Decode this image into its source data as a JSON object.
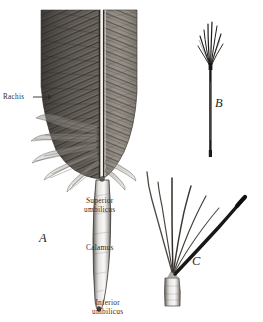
{
  "figure": {
    "kind": "engraving-plate",
    "background_color": "#ffffff",
    "ink_color": "#2b2b2b",
    "width": 263,
    "height": 322,
    "labels": [
      {
        "id": "rachis",
        "text": "Rachis",
        "has_leader_line": true
      },
      {
        "id": "superior",
        "text": "Superior\numbilicus",
        "has_leader_line": false
      },
      {
        "id": "calamus",
        "text": "Calamus",
        "has_leader_line": false
      },
      {
        "id": "inferior",
        "text": "Inferior\numbilicus",
        "has_leader_line": false
      }
    ],
    "panels": [
      {
        "id": "a",
        "letter": "A",
        "description": "whole contour feather: vane, rachis, downy afterfeather barbs, calamus"
      },
      {
        "id": "b",
        "letter": "B",
        "description": "slender dark shaft with splayed tuft of barbs at tip"
      },
      {
        "id": "c",
        "letter": "C",
        "description": "short calamus with fanned barbs and one heavy dark barb"
      }
    ]
  }
}
